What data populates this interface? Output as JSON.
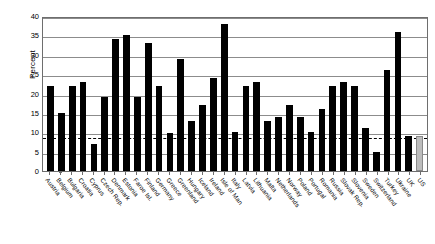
{
  "chart_data": {
    "type": "bar",
    "title": "",
    "xlabel": "",
    "ylabel": "Percent",
    "ylim": [
      0,
      40
    ],
    "yticks": [
      0,
      5,
      10,
      15,
      20,
      25,
      30,
      35,
      40
    ],
    "grid": true,
    "legend": "none",
    "reference_line": {
      "value": 9,
      "style": "dashed",
      "color": "#000000"
    },
    "colors": {
      "bar": "#000000",
      "highlight_bar": "#bdbdbd",
      "gridline": "#8c8c8c",
      "frame": "#6e6e6e",
      "background": "#ffffff"
    },
    "categories": [
      "Austria",
      "Belgium",
      "Bulgaria",
      "Croatia",
      "Cyprus",
      "Czech Rep.",
      "Denmark",
      "Estonia",
      "Faroe Isl.",
      "Finland",
      "Germany",
      "Greece",
      "Greenland",
      "Hungary",
      "Iceland",
      "Ireland",
      "Isle of Man",
      "Italy",
      "Latvia",
      "Lithuania",
      "Malta",
      "Netherlands",
      "Norway",
      "Poland",
      "Portugal",
      "Romania",
      "Russia",
      "Slovak Rep.",
      "Slovenia",
      "Sweden",
      "Switzerland",
      "Turkey",
      "Ukraine",
      "UK",
      "US"
    ],
    "values": [
      22,
      15,
      22,
      23,
      7,
      19,
      34,
      35,
      19,
      33,
      22,
      9.8,
      29,
      13,
      17,
      24,
      38,
      10,
      22,
      23,
      13,
      14,
      17,
      14,
      10,
      16,
      22,
      23,
      22,
      11,
      5,
      26,
      36,
      9,
      9
    ],
    "highlight_categories": [
      "US"
    ],
    "series": [
      {
        "name": "Percent",
        "values": [
          22,
          15,
          22,
          23,
          7,
          19,
          34,
          35,
          19,
          33,
          22,
          9.8,
          29,
          13,
          17,
          24,
          38,
          10,
          22,
          23,
          13,
          14,
          17,
          14,
          10,
          16,
          22,
          23,
          22,
          11,
          5,
          26,
          36,
          9,
          9
        ]
      }
    ]
  }
}
